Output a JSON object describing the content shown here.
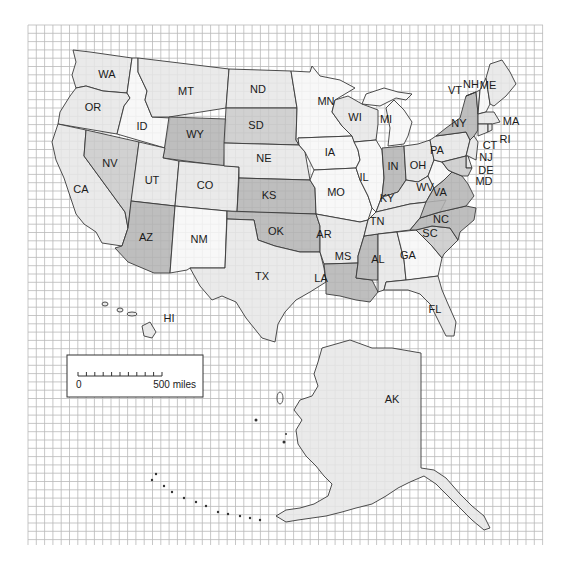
{
  "map": {
    "title": "United States grid map",
    "shade_colors": {
      "white": "#f7f7f7",
      "light": "#e6e6e6",
      "medium": "#c9c9c9",
      "dark": "#b3b3b3"
    },
    "grid_color": "#b9b9b9",
    "border_color": "#3a3a3a",
    "states": [
      {
        "abbr": "WA",
        "shade": "light"
      },
      {
        "abbr": "OR",
        "shade": "light"
      },
      {
        "abbr": "CA",
        "shade": "light"
      },
      {
        "abbr": "ID",
        "shade": "white"
      },
      {
        "abbr": "NV",
        "shade": "medium"
      },
      {
        "abbr": "MT",
        "shade": "light"
      },
      {
        "abbr": "WY",
        "shade": "dark"
      },
      {
        "abbr": "UT",
        "shade": "light"
      },
      {
        "abbr": "AZ",
        "shade": "dark"
      },
      {
        "abbr": "CO",
        "shade": "light"
      },
      {
        "abbr": "NM",
        "shade": "white"
      },
      {
        "abbr": "ND",
        "shade": "light"
      },
      {
        "abbr": "SD",
        "shade": "medium"
      },
      {
        "abbr": "NE",
        "shade": "light"
      },
      {
        "abbr": "KS",
        "shade": "dark"
      },
      {
        "abbr": "OK",
        "shade": "dark"
      },
      {
        "abbr": "TX",
        "shade": "light"
      },
      {
        "abbr": "MN",
        "shade": "white"
      },
      {
        "abbr": "IA",
        "shade": "white"
      },
      {
        "abbr": "MO",
        "shade": "white"
      },
      {
        "abbr": "AR",
        "shade": "light"
      },
      {
        "abbr": "LA",
        "shade": "dark"
      },
      {
        "abbr": "WI",
        "shade": "light"
      },
      {
        "abbr": "IL",
        "shade": "white"
      },
      {
        "abbr": "MS",
        "shade": "dark"
      },
      {
        "abbr": "MI",
        "shade": "white"
      },
      {
        "abbr": "IN",
        "shade": "dark"
      },
      {
        "abbr": "OH",
        "shade": "light"
      },
      {
        "abbr": "KY",
        "shade": "light"
      },
      {
        "abbr": "TN",
        "shade": "light"
      },
      {
        "abbr": "AL",
        "shade": "light"
      },
      {
        "abbr": "GA",
        "shade": "white"
      },
      {
        "abbr": "FL",
        "shade": "light"
      },
      {
        "abbr": "SC",
        "shade": "medium"
      },
      {
        "abbr": "NC",
        "shade": "dark"
      },
      {
        "abbr": "VA",
        "shade": "dark"
      },
      {
        "abbr": "WV",
        "shade": "white"
      },
      {
        "abbr": "PA",
        "shade": "light"
      },
      {
        "abbr": "NY",
        "shade": "dark"
      },
      {
        "abbr": "VT",
        "shade": "light"
      },
      {
        "abbr": "NH",
        "shade": "white"
      },
      {
        "abbr": "ME",
        "shade": "light"
      },
      {
        "abbr": "MA",
        "shade": "light"
      },
      {
        "abbr": "RI",
        "shade": "light"
      },
      {
        "abbr": "CT",
        "shade": "light"
      },
      {
        "abbr": "NJ",
        "shade": "light"
      },
      {
        "abbr": "DE",
        "shade": "light"
      },
      {
        "abbr": "MD",
        "shade": "medium"
      },
      {
        "abbr": "HI",
        "shade": "light"
      },
      {
        "abbr": "AK",
        "shade": "light"
      }
    ]
  },
  "scale": {
    "start_label": "0",
    "end_label": "500 miles",
    "divisions": 10
  }
}
